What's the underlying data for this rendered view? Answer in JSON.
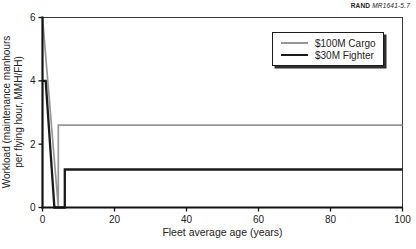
{
  "attribution": {
    "brand": "RAND",
    "doc_id": "MR1641-5.7"
  },
  "chart_data": {
    "type": "line",
    "title": "",
    "xlabel": "Fleet average age (years)",
    "ylabel_line1": "Workload (maintenance manhours",
    "ylabel_line2": "per flying hour, MMH/FH)",
    "xlim": [
      0,
      100
    ],
    "ylim": [
      0,
      6
    ],
    "x_ticks": [
      0,
      20,
      40,
      60,
      80,
      100
    ],
    "y_ticks": [
      0,
      2,
      4,
      6
    ],
    "grid": false,
    "legend_position": "top-right-inside",
    "series": [
      {
        "name": "$100M Cargo",
        "color": "#969696",
        "stroke_width": 1.7,
        "points": [
          [
            0,
            6
          ],
          [
            4.4,
            0
          ],
          [
            4.4,
            2.6
          ],
          [
            100,
            2.6
          ]
        ]
      },
      {
        "name": "$30M Fighter",
        "color": "#1a1a1a",
        "stroke_width": 2.3,
        "points": [
          [
            0,
            4
          ],
          [
            0.9,
            4
          ],
          [
            3.3,
            0
          ],
          [
            6.2,
            0
          ],
          [
            6.2,
            1.2
          ],
          [
            100,
            1.2
          ]
        ]
      }
    ]
  }
}
